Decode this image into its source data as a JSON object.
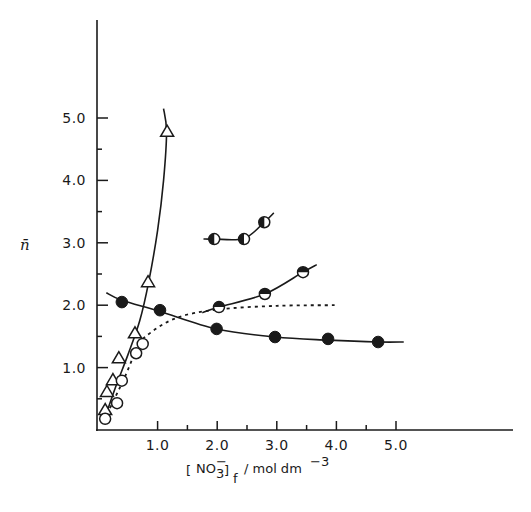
{
  "chart_data": {
    "type": "scatter",
    "title": "",
    "xlabel": "[NO3-]f / mol dm-3",
    "xlabel_parts": {
      "bracket_species": "NO",
      "subscript": "3",
      "superscript": "-",
      "outer_subscript": "f",
      "units": "/ mol dm",
      "units_exp": "-3"
    },
    "ylabel": "n̄",
    "xlim": [
      0,
      6.9
    ],
    "ylim": [
      0,
      6.5
    ],
    "x_ticks": [
      1.0,
      2.0,
      3.0,
      4.0,
      5.0
    ],
    "x_minor_ticks": [
      1.5,
      2.5,
      3.5,
      4.5
    ],
    "x_tick_labels": [
      "1.0",
      "2.0",
      "3.0",
      "4.0",
      "5.0"
    ],
    "y_ticks": [
      1.0,
      2.0,
      3.0,
      4.0,
      5.0
    ],
    "y_minor_ticks": [
      0.5,
      1.5,
      2.5,
      3.5,
      4.5
    ],
    "y_tick_labels": [
      "1.0",
      "2.0",
      "3.0",
      "4.0",
      "5.0"
    ],
    "grid": false,
    "legend": null,
    "series": [
      {
        "name": "open-triangles",
        "marker": "triangle-open",
        "line": "solid",
        "points": [
          [
            0.12,
            0.32
          ],
          [
            0.15,
            0.61
          ],
          [
            0.25,
            0.8
          ],
          [
            0.35,
            1.15
          ],
          [
            0.62,
            1.55
          ],
          [
            0.84,
            2.37
          ],
          [
            1.16,
            4.78
          ]
        ],
        "curve": [
          [
            0.1,
            0.15
          ],
          [
            0.3,
            0.7
          ],
          [
            0.5,
            1.2
          ],
          [
            0.7,
            1.75
          ],
          [
            0.85,
            2.37
          ],
          [
            1.0,
            3.2
          ],
          [
            1.1,
            4.0
          ],
          [
            1.15,
            4.78
          ],
          [
            1.1,
            5.15
          ]
        ]
      },
      {
        "name": "open-circles",
        "marker": "circle-open",
        "line": "dashed",
        "points": [
          [
            0.12,
            0.18
          ],
          [
            0.32,
            0.43
          ],
          [
            0.4,
            0.79
          ],
          [
            0.64,
            1.23
          ],
          [
            0.75,
            1.38
          ]
        ],
        "curve": [
          [
            0.2,
            0.35
          ],
          [
            0.45,
            0.85
          ],
          [
            0.65,
            1.3
          ],
          [
            0.8,
            1.5
          ],
          [
            1.3,
            1.79
          ],
          [
            2.0,
            1.93
          ],
          [
            3.0,
            1.99
          ],
          [
            3.97,
            2.0
          ]
        ]
      },
      {
        "name": "filled-circles",
        "marker": "circle-filled",
        "line": "solid",
        "points": [
          [
            0.4,
            2.05
          ],
          [
            1.04,
            1.92
          ],
          [
            1.99,
            1.62
          ],
          [
            2.97,
            1.49
          ],
          [
            3.86,
            1.46
          ],
          [
            4.7,
            1.41
          ]
        ],
        "curve": [
          [
            0.14,
            2.2
          ],
          [
            0.4,
            2.08
          ],
          [
            1.04,
            1.9
          ],
          [
            1.99,
            1.62
          ],
          [
            2.97,
            1.49
          ],
          [
            3.86,
            1.44
          ],
          [
            4.7,
            1.41
          ],
          [
            5.13,
            1.41
          ]
        ]
      },
      {
        "name": "half-filled-circles-rising",
        "marker": "circle-half-top",
        "line": "solid",
        "points": [
          [
            2.03,
            1.97
          ],
          [
            2.8,
            2.18
          ],
          [
            3.44,
            2.53
          ]
        ],
        "curve": [
          [
            1.75,
            1.88
          ],
          [
            2.03,
            1.97
          ],
          [
            2.8,
            2.18
          ],
          [
            3.44,
            2.53
          ],
          [
            3.67,
            2.65
          ]
        ]
      },
      {
        "name": "half-filled-circles-upper",
        "marker": "circle-half-left",
        "line": "solid",
        "points": [
          [
            1.95,
            3.06
          ],
          [
            2.45,
            3.06
          ],
          [
            2.79,
            3.33
          ]
        ],
        "curve": [
          [
            1.77,
            3.06
          ],
          [
            1.95,
            3.06
          ],
          [
            2.45,
            3.07
          ],
          [
            2.79,
            3.33
          ],
          [
            2.95,
            3.48
          ]
        ]
      }
    ]
  },
  "axes": {
    "x_tick_labels": [
      "1.0",
      "2.0",
      "3.0",
      "4.0",
      "5.0"
    ],
    "y_tick_labels": [
      "1.0",
      "2.0",
      "3.0",
      "4.0",
      "5.0"
    ],
    "ylabel": "n̄",
    "xlabel_species": "NO",
    "xlabel_sub": "3",
    "xlabel_sup": "−",
    "xlabel_outer_sub": "f",
    "xlabel_units": "/ mol dm",
    "xlabel_units_exp": "−3"
  }
}
